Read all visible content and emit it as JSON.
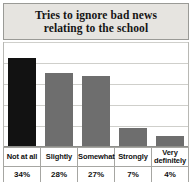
{
  "chart_data": {
    "type": "bar",
    "title": "Tries to ignore bad news relating to the school",
    "title_line1": "Tries to ignore bad news",
    "title_line2": "relating to the school",
    "xlabel": "",
    "ylabel": "",
    "ylim": [
      0,
      40
    ],
    "grid": true,
    "gridline_values": [
      8,
      16,
      24,
      32,
      40
    ],
    "legend": "none",
    "categories": [
      "Not at all",
      "Slightly",
      "Somewhat",
      "Strongly",
      "Very definitely"
    ],
    "values": [
      34,
      28,
      27,
      7,
      4
    ],
    "value_labels": [
      "34%",
      "28%",
      "27%",
      "7%",
      "4%"
    ],
    "bar_colors": [
      "#121212",
      "#6e6e6e",
      "#6e6e6e",
      "#6e6e6e",
      "#6e6e6e"
    ],
    "colors": {
      "first_bar": "#121212",
      "other_bars": "#6e6e6e",
      "banner_background": "#e6e4e0",
      "gridline": "#cfcfcb",
      "border": "#a6a6a2",
      "text": "#111111"
    }
  }
}
